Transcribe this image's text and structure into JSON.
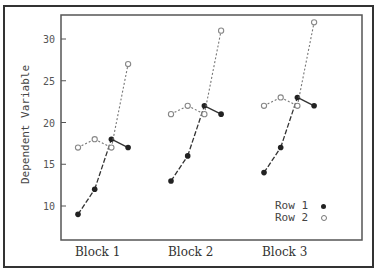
{
  "chart_data": {
    "type": "line",
    "title": "",
    "xlabel": "",
    "ylabel": "Dependent Variable",
    "ylim": [
      6,
      33
    ],
    "yticks": [
      10,
      15,
      20,
      25,
      30
    ],
    "categories": [
      "Block 1",
      "Block 2",
      "Block 3"
    ],
    "points_per_block": 4,
    "legend_position": "lower right",
    "grid": false,
    "series": [
      {
        "name": "Row 1",
        "marker": "filled-circle",
        "color": "#222222",
        "values": [
          [
            9,
            12,
            18,
            17
          ],
          [
            13,
            16,
            22,
            21
          ],
          [
            14,
            17,
            23,
            22
          ]
        ]
      },
      {
        "name": "Row 2",
        "marker": "open-circle",
        "color": "#888888",
        "values": [
          [
            17,
            18,
            17,
            27
          ],
          [
            21,
            22,
            21,
            31
          ],
          [
            22,
            23,
            22,
            32
          ]
        ]
      }
    ]
  },
  "labels": {
    "ylabel": "Dependent Variable",
    "block1": "Block 1",
    "block2": "Block 2",
    "block3": "Block 3",
    "legend_row1": "Row 1",
    "legend_row2": "Row 2"
  }
}
